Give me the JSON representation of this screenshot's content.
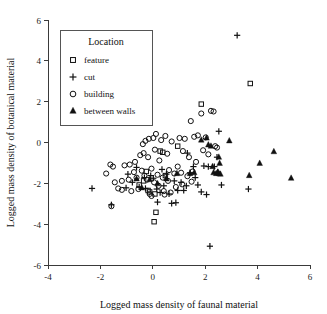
{
  "chart_data": {
    "type": "scatter",
    "title": "",
    "xlabel": "Logged mass density of faunal material",
    "ylabel": "Logged mass density of botanical material",
    "xlim": [
      -4,
      6
    ],
    "ylim": [
      -6,
      6
    ],
    "xticks": [
      -4,
      -2,
      0,
      2,
      4,
      6
    ],
    "yticks": [
      -6,
      -4,
      -2,
      0,
      2,
      4,
      6
    ],
    "xticklabels": [
      "-4",
      "-2",
      "0",
      "2",
      "4",
      "6"
    ],
    "yticklabels": [
      "-6",
      "-4",
      "-2",
      "0",
      "2",
      "4",
      "6"
    ],
    "grid": false,
    "legend": {
      "title": "Location",
      "position": "upper-left",
      "entries": [
        {
          "label": "feature",
          "marker": "square"
        },
        {
          "label": "cut",
          "marker": "plus"
        },
        {
          "label": "building",
          "marker": "circle"
        },
        {
          "label": "between walls",
          "marker": "triangle"
        }
      ]
    },
    "series": [
      {
        "name": "feature",
        "marker": "square",
        "points": [
          [
            3.72,
            2.89
          ],
          [
            1.85,
            1.88
          ],
          [
            0.28,
            -0.42
          ],
          [
            0.38,
            -0.48
          ],
          [
            -0.25,
            -1.42
          ],
          [
            -0.52,
            -2.08
          ],
          [
            -0.18,
            -2.35
          ],
          [
            -0.12,
            -2.42
          ],
          [
            0.08,
            -2.52
          ],
          [
            0.12,
            -3.42
          ],
          [
            0.05,
            -3.88
          ],
          [
            -0.35,
            -1.88
          ],
          [
            0.48,
            -1.62
          ],
          [
            0.95,
            -0.18
          ]
        ]
      },
      {
        "name": "cut",
        "marker": "plus",
        "points": [
          [
            3.22,
            5.25
          ],
          [
            2.18,
            -5.08
          ],
          [
            -2.32,
            -2.25
          ],
          [
            -1.58,
            -3.05
          ],
          [
            -0.62,
            -1.22
          ],
          [
            -0.78,
            -1.95
          ],
          [
            -0.52,
            -2.18
          ],
          [
            -0.32,
            -1.72
          ],
          [
            -0.28,
            -2.25
          ],
          [
            -0.08,
            -1.62
          ],
          [
            0.02,
            -1.75
          ],
          [
            0.15,
            -2.28
          ],
          [
            0.28,
            -2.45
          ],
          [
            0.42,
            -2.12
          ],
          [
            0.35,
            -1.32
          ],
          [
            0.52,
            -1.55
          ],
          [
            0.62,
            -2.52
          ],
          [
            0.72,
            -2.98
          ],
          [
            0.88,
            -2.95
          ],
          [
            0.95,
            -2.35
          ],
          [
            1.08,
            -1.95
          ],
          [
            1.18,
            -2.35
          ],
          [
            1.32,
            -0.52
          ],
          [
            1.42,
            -1.48
          ],
          [
            1.55,
            -1.18
          ],
          [
            1.62,
            -1.72
          ],
          [
            1.72,
            -2.08
          ],
          [
            1.85,
            -2.42
          ],
          [
            1.95,
            -1.15
          ],
          [
            2.05,
            -2.55
          ],
          [
            2.12,
            -1.18
          ],
          [
            2.35,
            -1.18
          ],
          [
            2.45,
            -0.72
          ],
          [
            2.52,
            0.55
          ],
          [
            2.48,
            -1.45
          ],
          [
            3.65,
            -2.28
          ],
          [
            0.18,
            -2.92
          ],
          [
            -1.02,
            -2.22
          ],
          [
            0.82,
            -1.88
          ],
          [
            1.28,
            -2.12
          ],
          [
            2.62,
            -2.08
          ],
          [
            -0.95,
            -1.55
          ]
        ]
      },
      {
        "name": "building",
        "marker": "circle",
        "points": [
          [
            -1.78,
            -1.52
          ],
          [
            -1.62,
            -1.08
          ],
          [
            -1.52,
            -1.18
          ],
          [
            -1.58,
            -3.12
          ],
          [
            -1.45,
            -1.95
          ],
          [
            -1.32,
            -2.25
          ],
          [
            -1.18,
            -2.32
          ],
          [
            -1.08,
            -1.12
          ],
          [
            -0.88,
            -1.08
          ],
          [
            -0.82,
            -2.38
          ],
          [
            -0.72,
            -1.45
          ],
          [
            -0.68,
            -0.95
          ],
          [
            -0.62,
            -1.72
          ],
          [
            -0.55,
            -2.28
          ],
          [
            -0.48,
            -0.62
          ],
          [
            -0.42,
            -1.38
          ],
          [
            -0.38,
            -0.08
          ],
          [
            -0.35,
            -0.52
          ],
          [
            -0.32,
            -1.62
          ],
          [
            -0.28,
            0.08
          ],
          [
            -0.22,
            -1.82
          ],
          [
            -0.18,
            -0.72
          ],
          [
            -0.15,
            0.18
          ],
          [
            -0.12,
            -2.52
          ],
          [
            -0.05,
            -1.28
          ],
          [
            0.02,
            0.22
          ],
          [
            0.08,
            -0.35
          ],
          [
            0.12,
            0.42
          ],
          [
            0.18,
            -1.58
          ],
          [
            0.22,
            -2.12
          ],
          [
            0.25,
            -0.88
          ],
          [
            0.32,
            0.12
          ],
          [
            0.38,
            -1.72
          ],
          [
            0.42,
            -2.38
          ],
          [
            0.48,
            0.32
          ],
          [
            0.55,
            -0.55
          ],
          [
            0.62,
            -1.35
          ],
          [
            0.68,
            -2.45
          ],
          [
            0.72,
            0.05
          ],
          [
            0.82,
            -1.52
          ],
          [
            0.88,
            -2.18
          ],
          [
            0.95,
            -1.18
          ],
          [
            1.02,
            0.22
          ],
          [
            1.08,
            -1.48
          ],
          [
            1.15,
            -0.42
          ],
          [
            1.22,
            0.18
          ],
          [
            1.32,
            -1.65
          ],
          [
            1.38,
            -0.72
          ],
          [
            1.45,
            1.05
          ],
          [
            1.52,
            -1.42
          ],
          [
            1.58,
            0.28
          ],
          [
            1.65,
            -0.95
          ],
          [
            1.72,
            0.35
          ],
          [
            1.85,
            1.42
          ],
          [
            1.92,
            -0.38
          ],
          [
            2.02,
            0.25
          ],
          [
            2.12,
            -0.58
          ],
          [
            2.22,
            1.55
          ],
          [
            2.32,
            1.52
          ],
          [
            2.38,
            -0.18
          ],
          [
            2.45,
            -0.25
          ],
          [
            -1.18,
            -1.88
          ],
          [
            -0.92,
            -1.82
          ],
          [
            0.05,
            -1.95
          ],
          [
            0.58,
            -1.88
          ],
          [
            1.12,
            -2.05
          ],
          [
            -0.05,
            -2.62
          ],
          [
            0.45,
            -2.55
          ],
          [
            1.48,
            -1.92
          ]
        ]
      },
      {
        "name": "between walls",
        "marker": "triangle",
        "points": [
          [
            5.28,
            -1.75
          ],
          [
            4.62,
            -0.45
          ],
          [
            4.08,
            -1.02
          ],
          [
            3.68,
            -1.62
          ],
          [
            2.92,
            0.08
          ],
          [
            2.52,
            -0.72
          ],
          [
            2.55,
            -1.02
          ],
          [
            2.48,
            -1.45
          ],
          [
            2.52,
            -1.52
          ],
          [
            2.58,
            -1.55
          ],
          [
            2.42,
            -1.52
          ],
          [
            2.28,
            -1.18
          ],
          [
            2.22,
            -0.18
          ],
          [
            2.12,
            -0.12
          ],
          [
            2.05,
            0.22
          ],
          [
            1.85,
            0.12
          ],
          [
            1.58,
            -1.48
          ],
          [
            1.42,
            -1.52
          ],
          [
            0.92,
            -1.52
          ],
          [
            0.52,
            -1.78
          ],
          [
            0.18,
            -2.02
          ],
          [
            -0.12,
            -1.82
          ],
          [
            -0.42,
            -2.22
          ],
          [
            -0.62,
            -1.78
          ],
          [
            2.32,
            -1.48
          ]
        ]
      }
    ]
  }
}
